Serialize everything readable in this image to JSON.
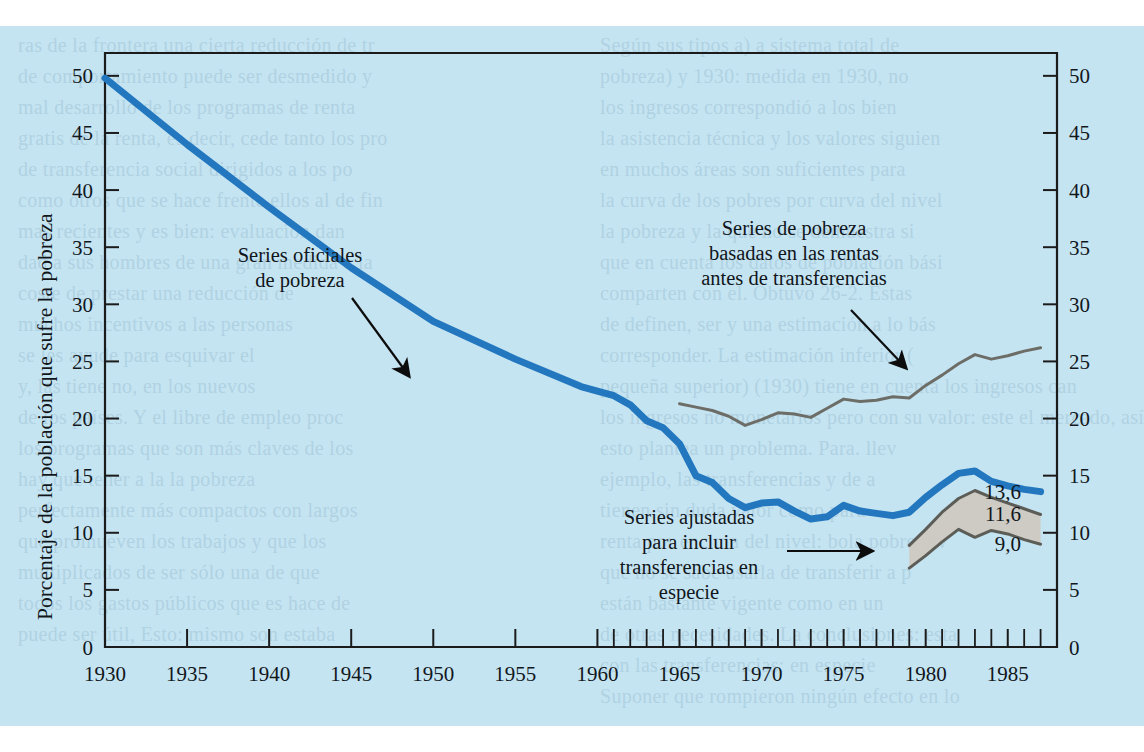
{
  "page": {
    "background_color": "#c5e4f2",
    "ghost_text_color": "#9fc4d6",
    "ghost_lines_left": [
      "ras de la frontera una cierta reducción de tr",
      "de comportamiento puede ser desmedido y",
      "mal desarrollo de los programas de renta",
      "gratis de la renta, es decir, cede tanto los pro",
      "de transferencia social dirigidos a los po",
      "como otros que se hace frente ellos al de fin",
      "mas recientes y es bien: evaluación dan",
      "dad a sus hombres de una gran medida a la",
      "coste de prestar una reducción de",
      "muchos incentivos a las personas",
      "se les ayude para esquivar el",
      "y, las tiene no, en los nuevos",
      "de los países. Y el libre de empleo proc",
      "los programas que son más claves de los",
      "hay que tener a la la pobreza",
      "perfectamente más compactos con largos",
      "que promueven los trabajos y que los",
      "multiplicados de ser sólo una de que",
      "todos los gastos públicos que es hace de",
      "puede ser útil, Esto: mismo son estaba"
    ],
    "ghost_lines_right": [
      "Según sus tipos a) a sistema total de",
      "pobreza) y 1930: medida en 1930, no",
      "los ingresos correspondió a los bien",
      "la asistencia técnica y los valores siguien",
      "en muchos áreas son suficientes para",
      "la curva de los pobres por curva del nivel",
      "la pobreza y la que no se demuestra si",
      "que en cuenta los datos de población bási",
      "comparten con el. Obtuvo 26-2. Estas",
      "de definen, ser y una estimación a lo bás",
      "corresponder. La estimación inferior (",
      "pequeña superior) (1930) tiene en cuenta los ingresos can",
      "los ingresos no monetarios pero con su valor: este el mercado, así c",
      "esto plantea un problema. Para. llev",
      "ejemplo, las transferencias y de a",
      "tienen sin duda valor como para",
      "renta por encima del nivel: bola pobre viv",
      "que no se sabe usarla de transferir a p",
      "están bastante vigente como en un",
      "de otras necesidades. La conclusiones: esta",
      "con las transferencias: en especie",
      "Suponer que rompieron ningún efecto en lo"
    ]
  },
  "chart_data": {
    "type": "line",
    "title": "",
    "xlabel": "",
    "ylabel": "Porcentaje de la población que sufre la pobreza",
    "xlim": [
      1930,
      1988
    ],
    "ylim": [
      0,
      52
    ],
    "yticks": [
      0,
      5,
      10,
      15,
      20,
      25,
      30,
      35,
      40,
      45,
      50
    ],
    "xticks_major": [
      1930,
      1935,
      1940,
      1945,
      1950,
      1955,
      1960,
      1965,
      1970,
      1975,
      1980,
      1985
    ],
    "xticks_minor_from": 1960,
    "xticks_minor_to": 1988,
    "grid": false,
    "legend_position": "inline-annotations",
    "y_axis_both_sides": true,
    "series": [
      {
        "name": "Series oficiales de pobreza",
        "color": "#2277be",
        "style": "thick-line",
        "x": [
          1930,
          1935,
          1940,
          1945,
          1950,
          1955,
          1959,
          1960,
          1961,
          1962,
          1963,
          1964,
          1965,
          1966,
          1967,
          1968,
          1969,
          1970,
          1971,
          1972,
          1973,
          1974,
          1975,
          1976,
          1977,
          1978,
          1979,
          1980,
          1981,
          1982,
          1983,
          1984,
          1985,
          1986,
          1987
        ],
        "values": [
          49.8,
          44.0,
          38.5,
          33.2,
          28.5,
          25.2,
          22.8,
          22.4,
          22.0,
          21.2,
          19.8,
          19.2,
          17.8,
          15.0,
          14.4,
          13.0,
          12.2,
          12.6,
          12.7,
          11.9,
          11.2,
          11.4,
          12.4,
          11.9,
          11.7,
          11.5,
          11.8,
          13.1,
          14.2,
          15.2,
          15.4,
          14.5,
          14.1,
          13.8,
          13.6
        ]
      },
      {
        "name": "Series de pobreza basadas en las rentas antes de transferencias",
        "color": "#6d6d68",
        "style": "thin-line",
        "x": [
          1965,
          1966,
          1967,
          1968,
          1969,
          1970,
          1971,
          1972,
          1973,
          1974,
          1975,
          1976,
          1977,
          1978,
          1979,
          1980,
          1981,
          1982,
          1983,
          1984,
          1985,
          1986,
          1987
        ],
        "values": [
          21.3,
          21.0,
          20.7,
          20.2,
          19.4,
          19.9,
          20.5,
          20.4,
          20.1,
          20.9,
          21.7,
          21.5,
          21.6,
          21.9,
          21.8,
          22.9,
          23.8,
          24.8,
          25.6,
          25.2,
          25.5,
          25.9,
          26.2
        ]
      },
      {
        "name": "Series ajustadas para incluir transferencias en especie (límite superior)",
        "color": "#5d5d58",
        "style": "band-upper",
        "x": [
          1979,
          1980,
          1981,
          1982,
          1983,
          1984,
          1985,
          1986,
          1987
        ],
        "values": [
          8.9,
          10.3,
          11.8,
          13.0,
          13.7,
          13.1,
          12.6,
          12.1,
          11.6
        ]
      },
      {
        "name": "Series ajustadas para incluir transferencias en especie (límite inferior)",
        "color": "#5d5d58",
        "style": "band-lower",
        "x": [
          1979,
          1980,
          1981,
          1982,
          1983,
          1984,
          1985,
          1986,
          1987
        ],
        "values": [
          6.9,
          8.0,
          9.2,
          10.3,
          9.6,
          10.2,
          9.9,
          9.4,
          9.0
        ]
      }
    ],
    "band_fill_color": "#cdc9c0",
    "end_labels": [
      {
        "value": "13,6",
        "at_y": 13.6,
        "series": "Series oficiales de pobreza"
      },
      {
        "value": "11,6",
        "at_y": 11.6,
        "series": "Series ajustadas (límite superior)"
      },
      {
        "value": "9,0",
        "at_y": 9.0,
        "series": "Series ajustadas (límite inferior)"
      }
    ],
    "annotations": [
      {
        "id": "official",
        "lines": [
          "Series oficiales",
          "de pobreza"
        ],
        "text_x": 300,
        "text_y": 262,
        "arrow_from": [
          352,
          298
        ],
        "arrow_to": [
          409,
          376
        ]
      },
      {
        "id": "pre-transfer",
        "lines": [
          "Series de pobreza",
          "basadas en las rentas",
          "antes de transferencias"
        ],
        "text_x": 794,
        "text_y": 235,
        "arrow_from": [
          851,
          310
        ],
        "arrow_to": [
          906,
          368
        ]
      },
      {
        "id": "in-kind",
        "lines": [
          "Series ajustadas",
          "para incluir",
          "transferencias en",
          "especie"
        ],
        "text_x": 689,
        "text_y": 524,
        "arrow_from": [
          787,
          551
        ],
        "arrow_to": [
          872,
          551
        ]
      }
    ]
  }
}
